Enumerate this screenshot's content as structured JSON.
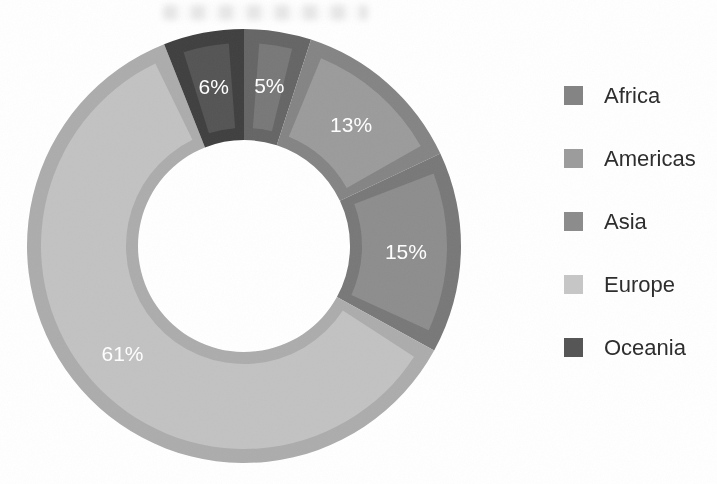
{
  "page": {
    "background": "#ffffff"
  },
  "chart_data": {
    "type": "pie",
    "subtype": "donut",
    "categories": [
      "Africa",
      "Americas",
      "Asia",
      "Europe",
      "Oceania"
    ],
    "values": [
      5,
      13,
      15,
      61,
      6
    ],
    "unit": "percent",
    "slice_labels": [
      "5%",
      "13%",
      "15%",
      "61%",
      "6%"
    ],
    "slice_fill_colors": [
      "#787878",
      "#9b9b9b",
      "#8d8d8d",
      "#c2c2c2",
      "#545454"
    ],
    "slice_edge_colors": [
      "#656565",
      "#848484",
      "#787878",
      "#acacac",
      "#3f3f3f"
    ],
    "slice_label_color": "#ffffff",
    "start_angle_deg": 0,
    "direction": "clockwise",
    "donut_hole_ratio": 0.49,
    "grid": false,
    "legend_position": "right"
  },
  "legend": {
    "items": [
      {
        "label": "Africa",
        "color": "#848484"
      },
      {
        "label": "Americas",
        "color": "#9c9c9c"
      },
      {
        "label": "Asia",
        "color": "#8c8c8c"
      },
      {
        "label": "Europe",
        "color": "#c6c6c6"
      },
      {
        "label": "Oceania",
        "color": "#565656"
      }
    ]
  }
}
